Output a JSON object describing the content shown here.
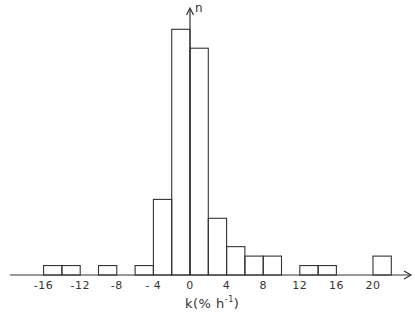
{
  "chart_data": {
    "type": "bar",
    "title": "",
    "xlabel": "k(% h⁻¹)",
    "xlabel_main": "k(% h",
    "xlabel_sup": "-1",
    "xlabel_close": ")",
    "ylabel": "n",
    "xlim": [
      -19,
      24
    ],
    "ylim": [
      0,
      28
    ],
    "grid": false,
    "legend": null,
    "bin_width": 2,
    "x_ticks": [
      -16,
      -12,
      -8,
      -4,
      0,
      4,
      8,
      12,
      16,
      20
    ],
    "x_tick_labels": [
      "-16",
      "-12",
      "-8",
      "- 4",
      "0",
      "4",
      "8",
      "12",
      "16",
      "20"
    ],
    "bins": [
      {
        "from": -16,
        "to": -14,
        "count": 1
      },
      {
        "from": -14,
        "to": -12,
        "count": 1
      },
      {
        "from": -10,
        "to": -8,
        "count": 1
      },
      {
        "from": -6,
        "to": -4,
        "count": 1
      },
      {
        "from": -4,
        "to": -2,
        "count": 8
      },
      {
        "from": -2,
        "to": 0,
        "count": 26
      },
      {
        "from": 0,
        "to": 2,
        "count": 24
      },
      {
        "from": 2,
        "to": 4,
        "count": 6
      },
      {
        "from": 4,
        "to": 6,
        "count": 3
      },
      {
        "from": 6,
        "to": 8,
        "count": 2
      },
      {
        "from": 8,
        "to": 10,
        "count": 2
      },
      {
        "from": 12,
        "to": 14,
        "count": 1
      },
      {
        "from": 14,
        "to": 16,
        "count": 1
      },
      {
        "from": 20,
        "to": 22,
        "count": 2
      }
    ]
  }
}
